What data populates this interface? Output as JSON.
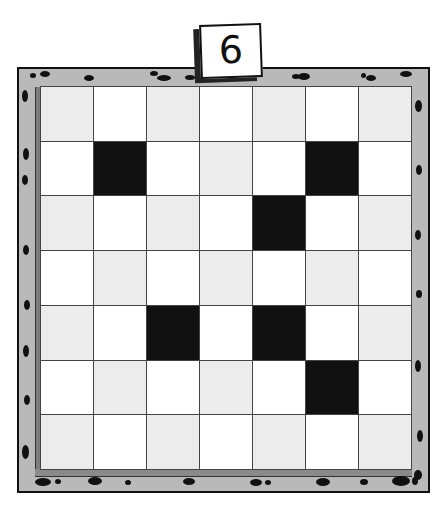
{
  "puzzle": {
    "number_label": "6",
    "rows": 7,
    "cols": 7,
    "colors": {
      "light": "#ececec",
      "white": "#ffffff",
      "black": "#111111",
      "frame": "#b9b9b9"
    },
    "grid": [
      [
        "L",
        "W",
        "L",
        "W",
        "L",
        "W",
        "L"
      ],
      [
        "W",
        "B",
        "W",
        "L",
        "W",
        "B",
        "W"
      ],
      [
        "L",
        "W",
        "L",
        "W",
        "B",
        "W",
        "L"
      ],
      [
        "W",
        "L",
        "W",
        "L",
        "W",
        "L",
        "W"
      ],
      [
        "L",
        "W",
        "B",
        "W",
        "B",
        "W",
        "L"
      ],
      [
        "W",
        "L",
        "W",
        "L",
        "W",
        "B",
        "W"
      ],
      [
        "L",
        "W",
        "L",
        "W",
        "L",
        "W",
        "L"
      ]
    ]
  }
}
